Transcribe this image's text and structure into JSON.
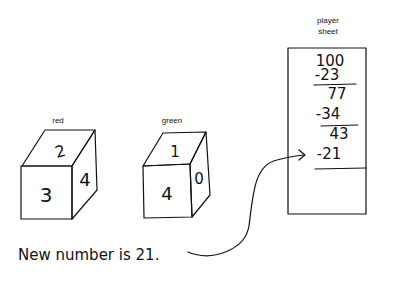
{
  "dice": [
    {
      "color_label": "red",
      "front": "3",
      "top": "2",
      "right": "4"
    },
    {
      "color_label": "green",
      "front": "4",
      "top": "1",
      "right": "0"
    }
  ],
  "player_sheet": {
    "title_line1": "player",
    "title_line2": "sheet",
    "lines": [
      "100",
      "-23",
      "77",
      "-34",
      "43",
      "-21"
    ]
  },
  "caption": "New number is 21."
}
